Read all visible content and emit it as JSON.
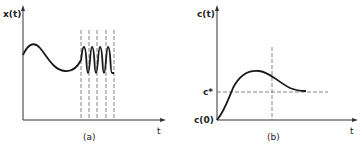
{
  "panels": [
    {
      "id": "a",
      "caption": "(a)",
      "y_label": "x(t)",
      "x_label": "t",
      "description": "Smooth slowly varying signal followed by rapid oscillations between dashed time markers"
    },
    {
      "id": "b",
      "caption": "(b)",
      "y_label": "c(t)",
      "x_label": "t",
      "reference_level_label": "c*",
      "initial_value_label": "c(0)",
      "description": "Response rising from c(0), peaking, then decaying toward level c*"
    }
  ],
  "colors": {
    "curve": "#1a1a1a",
    "axis": "#333333",
    "dashed": "#666666"
  }
}
